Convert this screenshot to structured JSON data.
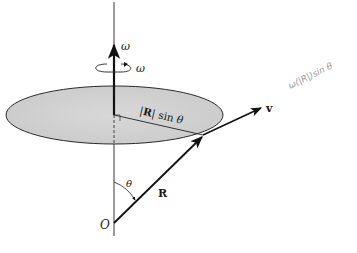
{
  "diagram": {
    "labels": {
      "omega_axis": "ω",
      "omega_rotation": "ω",
      "radius_projection": "|R| sin θ",
      "radius_projection_bold": "R",
      "velocity": "v",
      "position_vector": "R",
      "angle": "θ",
      "origin": "O"
    },
    "handwritten_note": "ω(|R|)sin θ",
    "colors": {
      "disk_fill": "#d4d4d4",
      "disk_edge": "#2a2a2a",
      "lines": "#111111",
      "handwriting": "#9a9a9a",
      "background": "#ffffff"
    }
  }
}
